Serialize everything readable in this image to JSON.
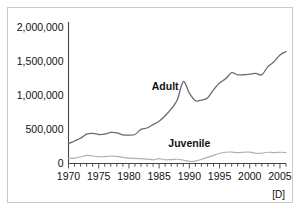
{
  "figure": {
    "note": "[D]",
    "frame_color": "#c9c9c9",
    "background": "#ffffff"
  },
  "chart_data": {
    "type": "line",
    "title": "",
    "subtitle": "",
    "xlabel": "",
    "ylabel": "",
    "xlim": [
      1970,
      2006
    ],
    "ylim": [
      0,
      2000000
    ],
    "grid": false,
    "legend": "inline-labels",
    "annotations": [
      "[D]"
    ],
    "yticks": [
      0,
      500000,
      1000000,
      1500000,
      2000000
    ],
    "ytick_labels": [
      "0",
      "500,000",
      "1,000,000",
      "1,500,000",
      "2,000,000"
    ],
    "xticks": [
      1970,
      1975,
      1980,
      1985,
      1990,
      1995,
      2000,
      2005
    ],
    "xtick_labels": [
      "1970",
      "1975",
      "1980",
      "1985",
      "1990",
      "1995",
      "2000",
      "2005"
    ],
    "minor_xtick_interval": 1,
    "x": [
      1970,
      1971,
      1972,
      1973,
      1974,
      1975,
      1976,
      1977,
      1978,
      1979,
      1980,
      1981,
      1982,
      1983,
      1984,
      1985,
      1986,
      1987,
      1988,
      1989,
      1990,
      1991,
      1992,
      1993,
      1994,
      1995,
      1996,
      1997,
      1998,
      1999,
      2000,
      2001,
      2002,
      2003,
      2004,
      2005,
      2006
    ],
    "series": [
      {
        "name": "Adult",
        "color": "#6b6b6b",
        "label_position": {
          "x": 1986,
          "y": 1080000
        },
        "values": [
          290000,
          330000,
          370000,
          430000,
          440000,
          425000,
          430000,
          455000,
          450000,
          420000,
          415000,
          425000,
          500000,
          520000,
          570000,
          620000,
          700000,
          800000,
          930000,
          1200000,
          1030000,
          920000,
          930000,
          960000,
          1080000,
          1180000,
          1240000,
          1330000,
          1300000,
          1300000,
          1310000,
          1320000,
          1300000,
          1420000,
          1490000,
          1590000,
          1640000
        ]
      },
      {
        "name": "Juvenile",
        "color": "#b0b0b0",
        "label_position": {
          "x": 1990,
          "y": 245000
        },
        "values": [
          75000,
          80000,
          95000,
          120000,
          110000,
          100000,
          100000,
          110000,
          105000,
          90000,
          80000,
          75000,
          70000,
          65000,
          55000,
          70000,
          55000,
          58000,
          62000,
          50000,
          30000,
          35000,
          60000,
          90000,
          120000,
          150000,
          165000,
          168000,
          160000,
          165000,
          168000,
          150000,
          150000,
          165000,
          160000,
          165000,
          160000
        ]
      }
    ]
  }
}
